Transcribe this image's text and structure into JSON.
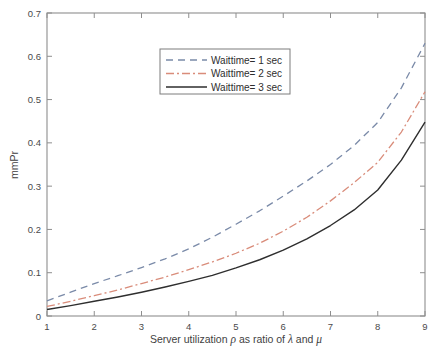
{
  "chart_data": {
    "type": "line",
    "title": "",
    "xlabel": "Server utilization ρ as ratio of λ and μ",
    "xlabel_parts": {
      "pre": "Server utilization ",
      "rho": "ρ",
      "mid": " as ratio of ",
      "lambda": "λ",
      "and": " and ",
      "mu": "μ"
    },
    "ylabel": "mmPr",
    "xlim": [
      1,
      9
    ],
    "ylim": [
      0,
      0.7
    ],
    "xticks": [
      1,
      2,
      3,
      4,
      5,
      6,
      7,
      8,
      9
    ],
    "xtick_labels": [
      "1",
      "2",
      "3",
      "4",
      "5",
      "6",
      "7",
      "8",
      "9"
    ],
    "yticks": [
      0,
      0.1,
      0.2,
      0.3,
      0.4,
      0.5,
      0.6,
      0.7
    ],
    "ytick_labels": [
      "0",
      "0.1",
      "0.2",
      "0.3",
      "0.4",
      "0.5",
      "0.6",
      "0.7"
    ],
    "grid": false,
    "legend_position": "upper-center-left",
    "x": [
      1,
      1.5,
      2,
      2.5,
      3,
      3.5,
      4,
      4.5,
      5,
      5.5,
      6,
      6.5,
      7,
      7.5,
      8,
      8.5,
      9
    ],
    "series": [
      {
        "name": "Waittime= 1 sec",
        "label": "Waittime= 1 sec",
        "color": "#7a8aa8",
        "style": "dashed",
        "dasharray": "7,5",
        "width": 1.3,
        "values": [
          0.035,
          0.055,
          0.075,
          0.093,
          0.112,
          0.132,
          0.155,
          0.182,
          0.212,
          0.243,
          0.277,
          0.312,
          0.35,
          0.394,
          0.447,
          0.527,
          0.63
        ]
      },
      {
        "name": "Waittime= 2 sec",
        "label": "Waittime= 2 sec",
        "color": "#d98c7a",
        "style": "dash-dot",
        "dasharray": "8,3,2,3",
        "width": 1.3,
        "values": [
          0.022,
          0.034,
          0.047,
          0.06,
          0.075,
          0.09,
          0.107,
          0.125,
          0.145,
          0.168,
          0.196,
          0.228,
          0.266,
          0.308,
          0.355,
          0.425,
          0.518
        ]
      },
      {
        "name": "Waittime= 3 sec",
        "label": "Waittime= 3 sec",
        "color": "#2e2e2e",
        "style": "solid",
        "dasharray": "none",
        "width": 1.4,
        "values": [
          0.015,
          0.024,
          0.034,
          0.044,
          0.055,
          0.067,
          0.08,
          0.094,
          0.111,
          0.13,
          0.152,
          0.178,
          0.209,
          0.245,
          0.291,
          0.36,
          0.448
        ]
      }
    ],
    "legend_entries": [
      {
        "label": "Waittime= 1 sec",
        "color": "#7a8aa8",
        "style": "dashed"
      },
      {
        "label": "Waittime= 2 sec",
        "color": "#d98c7a",
        "style": "dash-dot"
      },
      {
        "label": "Waittime= 3 sec",
        "color": "#2e2e2e",
        "style": "solid"
      }
    ]
  }
}
